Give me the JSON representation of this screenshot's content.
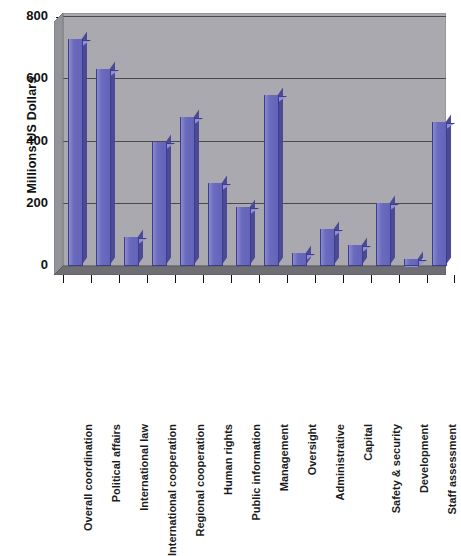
{
  "chart_data": {
    "type": "bar",
    "title": "",
    "subtitle": "",
    "xlabel": "",
    "ylabel": "Millions US Dollars",
    "ylim": [
      0,
      800
    ],
    "yticks": [
      0,
      200,
      400,
      600,
      800
    ],
    "grid": true,
    "legend": null,
    "style": "3d-column",
    "categories": [
      "Overall coordination",
      "Political affairs",
      "International law",
      "International cooperation",
      "Regional cooperation",
      "Human rights",
      "Public information",
      "Management",
      "Oversight",
      "Administrative",
      "Capital",
      "Safety & security",
      "Development",
      "Staff assessment"
    ],
    "values": [
      725,
      630,
      90,
      395,
      475,
      262,
      185,
      545,
      40,
      115,
      65,
      200,
      20,
      460
    ],
    "units": "Millions US Dollars",
    "colors": {
      "bar_face": "#6a6abe",
      "bar_top": "#8f8fd4",
      "bar_side": "#4a4a96",
      "bar_outline": "#3e3e86",
      "plot_background": "#a9a9af",
      "floor": "#6e6e74",
      "gridline": "#3a3a3a",
      "text": "#111111",
      "page_background": "#ffffff"
    }
  },
  "axis": {
    "y_tick_labels": [
      "800",
      "600",
      "400",
      "200",
      "0"
    ],
    "y_axis_title": "Millions US Dollars"
  }
}
